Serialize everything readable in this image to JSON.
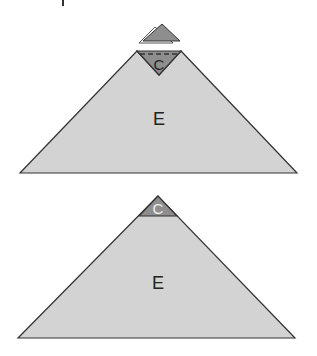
{
  "diagram": {
    "top_figure": {
      "detached_cap_label": "",
      "cap_label": "C",
      "body_label": "E"
    },
    "bottom_figure": {
      "cap_label": "C",
      "body_label": "E"
    },
    "colors": {
      "body_fill": "#d3d3d3",
      "cap_fill": "#8e8e8e",
      "stroke": "#333333",
      "cap_label_bottom": "#eeeeee",
      "background": "#ffffff"
    }
  }
}
